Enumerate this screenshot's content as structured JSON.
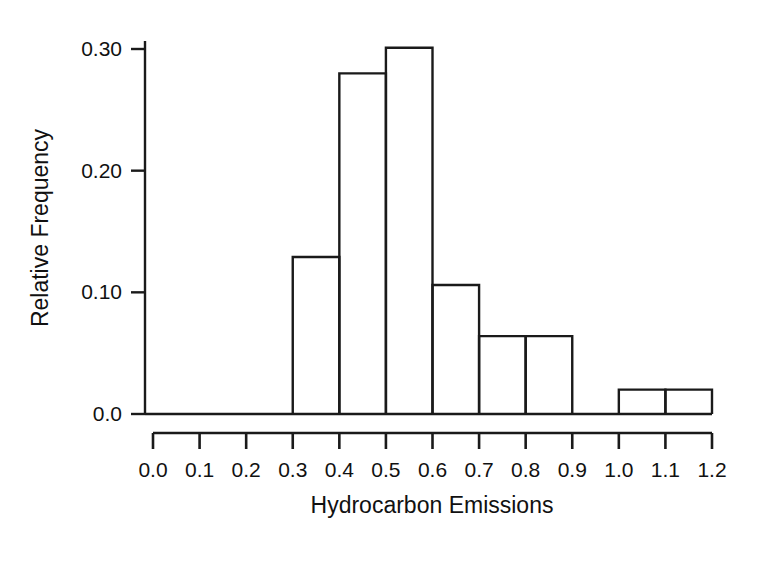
{
  "chart_data": {
    "type": "bar",
    "title": "",
    "subtitle": "",
    "xlabel": "Hydrocarbon Emissions",
    "ylabel": "Relative Frequency",
    "grid": false,
    "legend": "none",
    "xlim": [
      0.0,
      1.2
    ],
    "ylim": [
      0.0,
      0.3
    ],
    "bin_width": 0.1,
    "xticks": [
      "0.0",
      "0.1",
      "0.2",
      "0.3",
      "0.4",
      "0.5",
      "0.6",
      "0.7",
      "0.8",
      "0.9",
      "1.0",
      "1.1",
      "1.2"
    ],
    "xtick_values": [
      0.0,
      0.1,
      0.2,
      0.3,
      0.4,
      0.5,
      0.6,
      0.7,
      0.8,
      0.9,
      1.0,
      1.1,
      1.2
    ],
    "yticks": [
      "0.0",
      "0.10",
      "0.20",
      "0.30"
    ],
    "ytick_values": [
      0.0,
      0.1,
      0.2,
      0.3
    ],
    "bins": [
      {
        "left": 0.0,
        "right": 0.1,
        "value": 0.0
      },
      {
        "left": 0.1,
        "right": 0.2,
        "value": 0.0
      },
      {
        "left": 0.2,
        "right": 0.3,
        "value": 0.0
      },
      {
        "left": 0.3,
        "right": 0.4,
        "value": 0.129
      },
      {
        "left": 0.4,
        "right": 0.5,
        "value": 0.28
      },
      {
        "left": 0.5,
        "right": 0.6,
        "value": 0.301
      },
      {
        "left": 0.6,
        "right": 0.7,
        "value": 0.106
      },
      {
        "left": 0.7,
        "right": 0.8,
        "value": 0.064
      },
      {
        "left": 0.8,
        "right": 0.9,
        "value": 0.064
      },
      {
        "left": 0.9,
        "right": 1.0,
        "value": 0.0
      },
      {
        "left": 1.0,
        "right": 1.1,
        "value": 0.02
      },
      {
        "left": 1.1,
        "right": 1.2,
        "value": 0.02
      }
    ],
    "categories": [
      "0.0-0.1",
      "0.1-0.2",
      "0.2-0.3",
      "0.3-0.4",
      "0.4-0.5",
      "0.5-0.6",
      "0.6-0.7",
      "0.7-0.8",
      "0.8-0.9",
      "0.9-1.0",
      "1.0-1.1",
      "1.1-1.2"
    ],
    "values": [
      0.0,
      0.0,
      0.0,
      0.129,
      0.28,
      0.301,
      0.106,
      0.064,
      0.064,
      0.0,
      0.02,
      0.02
    ],
    "colors": {
      "bar_stroke": "#1a1a1a",
      "bar_fill": "none",
      "axis": "#1a1a1a",
      "background": "#ffffff",
      "text": "#111111"
    }
  }
}
